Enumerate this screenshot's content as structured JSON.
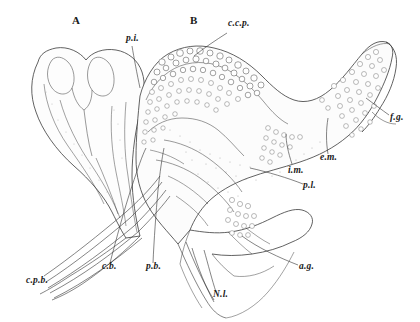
{
  "figure": {
    "type": "line-drawing",
    "panels": [
      {
        "id": "A",
        "label": "A",
        "x": 72,
        "y": 14
      },
      {
        "id": "B",
        "label": "B",
        "x": 190,
        "y": 14
      }
    ],
    "labels": [
      {
        "key": "ccp",
        "text": "c.c.p.",
        "x": 228,
        "y": 24,
        "anchor": "start"
      },
      {
        "key": "pi_top",
        "text": "p.i.",
        "x": 126,
        "y": 38,
        "anchor": "start"
      },
      {
        "key": "fg",
        "text": "f.g.",
        "x": 390,
        "y": 117,
        "anchor": "start"
      },
      {
        "key": "em",
        "text": "e.m.",
        "x": 324,
        "y": 158,
        "anchor": "start"
      },
      {
        "key": "im",
        "text": "i.m.",
        "x": 290,
        "y": 168,
        "anchor": "start"
      },
      {
        "key": "pl",
        "text": "p.l.",
        "x": 305,
        "y": 186,
        "anchor": "start"
      },
      {
        "key": "ag",
        "text": "a.g.",
        "x": 300,
        "y": 268,
        "anchor": "start"
      },
      {
        "key": "nl",
        "text": "N.l.",
        "x": 214,
        "y": 296,
        "anchor": "start"
      },
      {
        "key": "pb",
        "text": "p.b.",
        "x": 148,
        "y": 268,
        "anchor": "start"
      },
      {
        "key": "cb",
        "text": "c.b.",
        "x": 104,
        "y": 268,
        "anchor": "start"
      },
      {
        "key": "cpb",
        "text": "c.p.b.",
        "x": 28,
        "y": 282,
        "anchor": "start"
      }
    ],
    "ink_color": "#2b2b2b",
    "fill_color": "#fbfbfb",
    "background": "#ffffff"
  }
}
